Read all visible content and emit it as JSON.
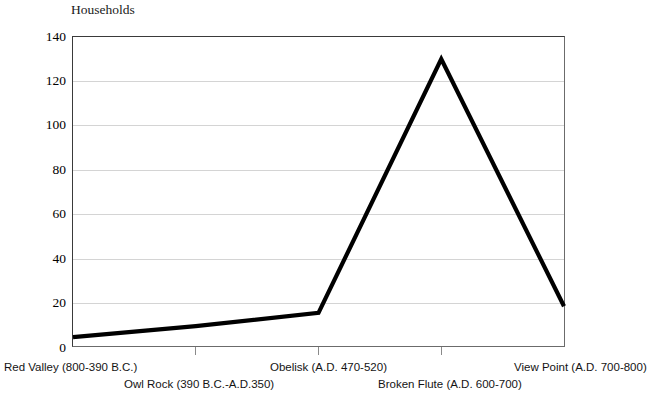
{
  "chart_data": {
    "type": "line",
    "title": "Households",
    "xlabel": "",
    "ylabel": "Households",
    "categories": [
      "Red Valley (800-390 B.C.)",
      "Owl Rock (390 B.C.-A.D.350)",
      "Obelisk (A.D. 470-520)",
      "Broken Flute (A.D. 600-700)",
      "View Point (A.D. 700-800)"
    ],
    "values": [
      4,
      9,
      15,
      130,
      18
    ],
    "ylim": [
      0,
      140
    ],
    "ytick_labels": [
      "140",
      "120",
      "100",
      "80",
      "60",
      "40",
      "20",
      "0"
    ],
    "ytick_values": [
      140,
      120,
      100,
      80,
      60,
      40,
      20,
      0
    ],
    "grid": true,
    "legend": false,
    "series": [
      {
        "name": "Households",
        "values": [
          4,
          9,
          15,
          130,
          18
        ],
        "color": "#000000"
      }
    ]
  },
  "axis": {
    "y_title": "Households",
    "line_color": "#000000",
    "grid_color": "#d4d4d4",
    "frame_color": "#3a3a3a"
  },
  "x_labels": [
    {
      "text": "Red Valley (800-390 B.C.)",
      "row": "top"
    },
    {
      "text": "Owl Rock (390 B.C.-A.D.350)",
      "row": "bot"
    },
    {
      "text": "Obelisk (A.D. 470-520)",
      "row": "top"
    },
    {
      "text": "Broken Flute (A.D. 600-700)",
      "row": "bot"
    },
    {
      "text": "View Point (A.D. 700-800)",
      "row": "top"
    }
  ]
}
